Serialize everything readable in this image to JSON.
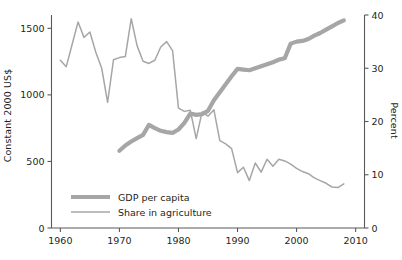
{
  "chart_data": {
    "type": "line",
    "title": "",
    "xlabel": "",
    "ylabel": "Constant 2000 US$",
    "ylabel_right": "Percent",
    "xlim": [
      1958.5,
      2011.5
    ],
    "ylim": [
      0,
      1600
    ],
    "ylim_right": [
      0,
      40
    ],
    "grid": false,
    "legend_position": "inside-lower-left",
    "xticks": [
      1960,
      1970,
      1980,
      1990,
      2000,
      2010
    ],
    "xtick_labels": [
      "1960",
      "1970",
      "1980",
      "1990",
      "2000",
      "2010"
    ],
    "yticks_left": [
      0,
      500,
      1000,
      1500
    ],
    "ytick_labels_left": [
      "0",
      "500",
      "1000",
      "1500"
    ],
    "yticks_right": [
      0,
      10,
      20,
      30,
      40
    ],
    "ytick_labels_right": [
      "0",
      "10",
      "20",
      "30",
      "40"
    ],
    "series": [
      {
        "name": "GDP per capita",
        "axis": "left",
        "color": "#a6a6a6",
        "linewidth": 4.2,
        "x": [
          1970,
          1971,
          1972,
          1973,
          1974,
          1975,
          1976,
          1977,
          1978,
          1979,
          1980,
          1981,
          1982,
          1983,
          1984,
          1985,
          1986,
          1987,
          1988,
          1989,
          1990,
          1991,
          1992,
          1993,
          1994,
          1995,
          1996,
          1997,
          1998,
          1999,
          2000,
          2001,
          2002,
          2003,
          2004,
          2005,
          2006,
          2007,
          2008
        ],
        "values": [
          580,
          620,
          650,
          675,
          700,
          775,
          750,
          730,
          720,
          715,
          740,
          790,
          860,
          850,
          855,
          880,
          960,
          1020,
          1080,
          1140,
          1195,
          1190,
          1185,
          1200,
          1215,
          1230,
          1245,
          1265,
          1275,
          1385,
          1400,
          1405,
          1420,
          1445,
          1465,
          1490,
          1515,
          1540,
          1560
        ]
      },
      {
        "name": "Share in agriculture",
        "axis": "right",
        "color": "#a6a6a6",
        "linewidth": 1.5,
        "x": [
          1960,
          1961,
          1962,
          1963,
          1964,
          1965,
          1966,
          1967,
          1968,
          1969,
          1970,
          1971,
          1972,
          1973,
          1974,
          1975,
          1976,
          1977,
          1978,
          1979,
          1980,
          1981,
          1982,
          1983,
          1984,
          1985,
          1986,
          1987,
          1988,
          1989,
          1990,
          1991,
          1992,
          1993,
          1994,
          1995,
          1996,
          1997,
          1998,
          1999,
          2000,
          2001,
          2002,
          2003,
          2004,
          2005,
          2006,
          2007,
          2008
        ],
        "values": [
          31.5,
          30.3,
          34.5,
          38.7,
          35.8,
          36.8,
          33.0,
          30.0,
          23.6,
          31.6,
          32.0,
          32.2,
          39.3,
          34.2,
          31.3,
          30.9,
          31.5,
          34.0,
          35.0,
          33.3,
          22.5,
          21.9,
          22.1,
          16.8,
          21.8,
          21.0,
          22.2,
          16.4,
          15.8,
          14.9,
          10.4,
          11.4,
          8.9,
          12.2,
          10.5,
          12.9,
          11.6,
          12.9,
          12.6,
          12.0,
          11.2,
          10.6,
          10.2,
          9.4,
          8.9,
          8.4,
          7.7,
          7.6,
          8.3
        ]
      }
    ]
  },
  "legend": {
    "items": [
      {
        "label": "GDP per capita",
        "style": "thick"
      },
      {
        "label": "Share in agriculture",
        "style": "thin"
      }
    ]
  },
  "colors": {
    "line": "#a6a6a6",
    "axis": "#58595b",
    "text": "#231f20"
  }
}
